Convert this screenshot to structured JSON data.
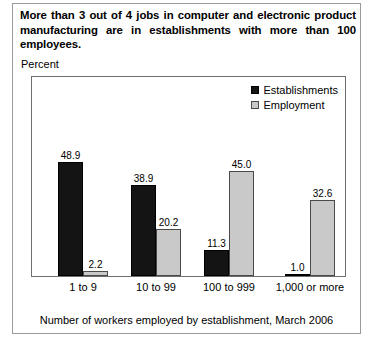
{
  "title": "More than 3 out of 4 jobs in computer and electronic product manufacturing are in establishments with more than 100 employees.",
  "axis_title": "Percent",
  "footer": "Number of workers employed by establishment, March 2006",
  "legend": [
    {
      "label": "Establishments",
      "color": "#141414"
    },
    {
      "label": "Employment",
      "color": "#c9c9c9"
    }
  ],
  "chart_data": {
    "type": "bar",
    "title": "More than 3 out of 4 jobs in computer and electronic product manufacturing are in establishments with more than 100 employees.",
    "xlabel": "Number of workers employed by establishment, March 2006",
    "ylabel": "Percent",
    "ylim": [
      0,
      85
    ],
    "grid": false,
    "legend_position": "top-right",
    "categories": [
      "1 to 9",
      "10 to 99",
      "100 to 999",
      "1,000 or more"
    ],
    "series": [
      {
        "name": "Establishments",
        "color": "#141414",
        "values": [
          48.9,
          38.9,
          11.3,
          1.0
        ]
      },
      {
        "name": "Employment",
        "color": "#c9c9c9",
        "values": [
          2.2,
          20.2,
          45.0,
          32.6
        ]
      }
    ],
    "value_labels": [
      "48.9",
      "2.2",
      "38.9",
      "20.2",
      "11.3",
      "45.0",
      "1.0",
      "32.6"
    ]
  }
}
